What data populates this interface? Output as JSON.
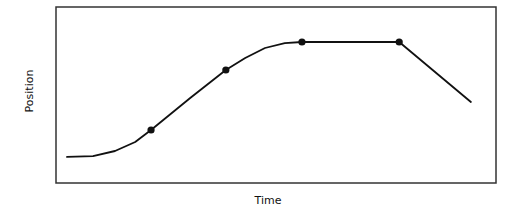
{
  "chart_data": {
    "type": "line",
    "title": "",
    "xlabel": "Time",
    "ylabel": "Position",
    "xlim": [
      0,
      10
    ],
    "ylim": [
      0,
      10
    ],
    "grid": false,
    "x_ticks": [],
    "y_ticks": [],
    "series": [
      {
        "name": "position",
        "color": "#111111",
        "x": [
          0.25,
          0.84,
          1.34,
          1.8,
          2.16,
          3.05,
          3.86,
          4.3,
          4.75,
          5.2,
          5.59,
          7.8,
          9.43
        ],
        "y": [
          1.48,
          1.53,
          1.82,
          2.33,
          3.01,
          4.83,
          6.42,
          7.1,
          7.67,
          7.95,
          8.01,
          8.01,
          4.6
        ]
      }
    ],
    "markers": [
      {
        "x": 2.16,
        "y": 3.01
      },
      {
        "x": 3.86,
        "y": 6.42
      },
      {
        "x": 5.59,
        "y": 8.01
      },
      {
        "x": 7.8,
        "y": 8.01
      }
    ]
  }
}
